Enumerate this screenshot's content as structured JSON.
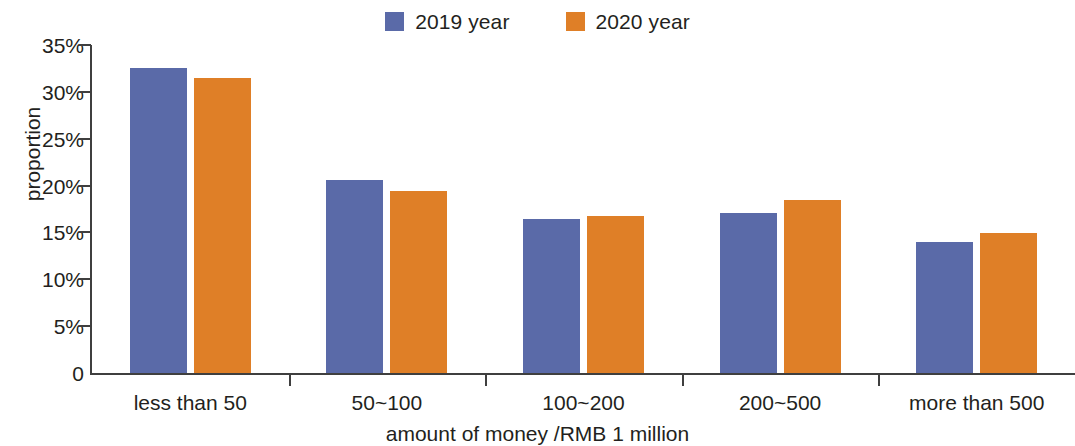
{
  "chart_data": {
    "type": "bar",
    "title": "",
    "categories": [
      "less than 50",
      "50~100",
      "100~200",
      "200~500",
      "more than 500"
    ],
    "series": [
      {
        "name": "2019 year",
        "color": "#5a6aa8",
        "values": [
          32.6,
          20.6,
          16.4,
          17.1,
          14.0
        ]
      },
      {
        "name": "2020 year",
        "color": "#df7f27",
        "values": [
          31.5,
          19.4,
          16.8,
          18.5,
          14.9
        ]
      }
    ],
    "xlabel": "amount of money /RMB 1 million",
    "ylabel": "proportion",
    "ylim": [
      0,
      35
    ],
    "ytick_values": [
      35,
      30,
      25,
      20,
      15,
      10,
      5,
      0
    ],
    "ytick_labels": [
      "35%",
      "30%",
      "25%",
      "20%",
      "15%",
      "10%",
      "5%",
      "0"
    ],
    "grid": false,
    "legend_position": "top-center"
  },
  "legend": {
    "items": [
      {
        "label": "2019 year",
        "swatch": "legend-swatch-2019",
        "color": "#5a6aa8"
      },
      {
        "label": "2020 year",
        "swatch": "legend-swatch-2020",
        "color": "#df7f27"
      }
    ]
  },
  "axes": {
    "y_title": "proportion",
    "x_title": "amount of money /RMB 1 million"
  }
}
